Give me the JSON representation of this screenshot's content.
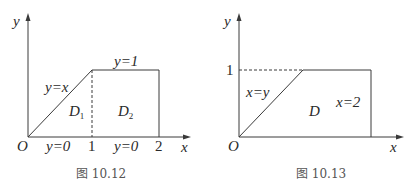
{
  "figures": [
    {
      "caption": "图 10.12",
      "axis_x": "x",
      "axis_y": "y",
      "origin": "O",
      "ticks_x": [
        "1",
        "2"
      ],
      "curves": {
        "diagonal": "y=x",
        "top": "y=1",
        "bottom_left": "y=0",
        "bottom_right": "y=0"
      },
      "regions": [
        {
          "name": "D",
          "sub": "1"
        },
        {
          "name": "D",
          "sub": "2"
        }
      ]
    },
    {
      "caption": "图 10.13",
      "axis_x": "x",
      "axis_y": "y",
      "origin": "O",
      "ticks_y": [
        "1"
      ],
      "curves": {
        "diagonal": "x=y",
        "right": "x=2"
      },
      "regions": [
        {
          "name": "D"
        }
      ]
    }
  ],
  "colors": {
    "line": "#3a3a3a",
    "text": "#2a2a2a"
  }
}
